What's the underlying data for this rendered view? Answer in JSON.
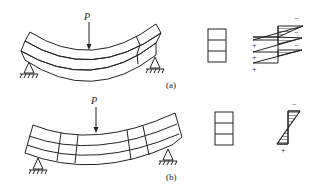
{
  "figure": {
    "panel_a": {
      "label": "(a)",
      "load_label": "P",
      "description": "Three unbonded stacked layers, each bending independently",
      "layers": 3,
      "section_signs": {
        "top_minus": [
          "−",
          "−",
          "−"
        ],
        "bottom_plus": [
          "+",
          "+",
          "+"
        ]
      }
    },
    "panel_b": {
      "label": "(b)",
      "load_label": "P",
      "description": "Bonded composite beam bending as one unit",
      "layers": 3,
      "section_signs": {
        "top": "−",
        "bottom": "+"
      }
    },
    "colors": {
      "line": "#222222",
      "background": "#ffffff",
      "hatch": "#555555"
    }
  }
}
